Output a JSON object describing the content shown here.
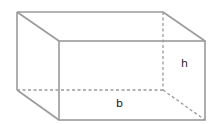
{
  "diagram": {
    "type": "rectangular-prism",
    "labels": {
      "height": "h",
      "base": "b"
    },
    "colors": {
      "edge": "#9a9a9a",
      "text": "#222222"
    }
  }
}
